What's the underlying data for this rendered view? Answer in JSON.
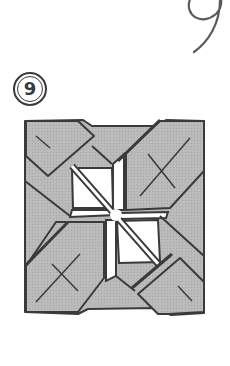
{
  "page": {
    "page_number": "9",
    "step_number": "9",
    "step_label": "Step 9"
  },
  "diagram": {
    "colors": {
      "paper_gray": "#b9b9b9",
      "paper_white": "#ffffff",
      "line": "#3a3a3a"
    },
    "marks": [
      "x-mark-top-right",
      "x-mark-bottom-left",
      "slash-mark-top-left",
      "slash-mark-bottom-right"
    ]
  }
}
